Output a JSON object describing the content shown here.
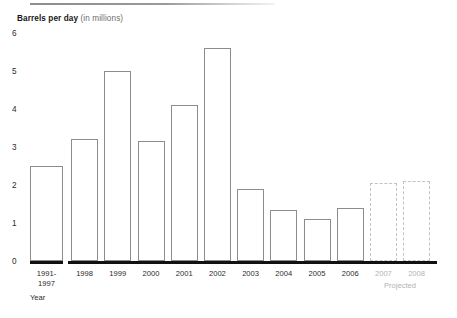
{
  "chart_data": {
    "type": "bar",
    "title_main": "Barrels per day",
    "title_sub": "(in millions)",
    "xlabel": "Year",
    "ylabel": "Barrels per day (in millions)",
    "ylim": [
      0,
      6
    ],
    "yticks": [
      0,
      1,
      2,
      3,
      4,
      5,
      6
    ],
    "ytick_labels": [
      "0",
      "1",
      "2",
      "3",
      "4",
      "5",
      "6"
    ],
    "grid": false,
    "legend": null,
    "categories": [
      "1991-1997",
      "1998",
      "1999",
      "2000",
      "2001",
      "2002",
      "2003",
      "2004",
      "2005",
      "2006",
      "2007",
      "2008"
    ],
    "category_labels": [
      {
        "line1": "1991-",
        "line2": "1997"
      },
      {
        "line1": "1998",
        "line2": ""
      },
      {
        "line1": "1999",
        "line2": ""
      },
      {
        "line1": "2000",
        "line2": ""
      },
      {
        "line1": "2001",
        "line2": ""
      },
      {
        "line1": "2002",
        "line2": ""
      },
      {
        "line1": "2003",
        "line2": ""
      },
      {
        "line1": "2004",
        "line2": ""
      },
      {
        "line1": "2005",
        "line2": ""
      },
      {
        "line1": "2006",
        "line2": ""
      },
      {
        "line1": "2007",
        "line2": ""
      },
      {
        "line1": "2008",
        "line2": ""
      }
    ],
    "values": [
      2.5,
      3.2,
      5.0,
      3.15,
      4.1,
      5.6,
      1.9,
      1.35,
      1.1,
      1.4,
      2.05,
      2.1
    ],
    "projected_flags": [
      false,
      false,
      false,
      false,
      false,
      false,
      false,
      false,
      false,
      false,
      true,
      true
    ],
    "annotations": [
      {
        "text": "Projected",
        "applies_to": [
          "2007",
          "2008"
        ]
      }
    ],
    "colors": {
      "bar_fill": "#ffffff",
      "bar_stroke": "#8c8c8c",
      "projected_stroke": "#c2c2c2",
      "axis": "#111111",
      "text": "#2b2b2b",
      "muted_text": "#b3b3b3",
      "subtitle": "#6e6e6e"
    }
  }
}
